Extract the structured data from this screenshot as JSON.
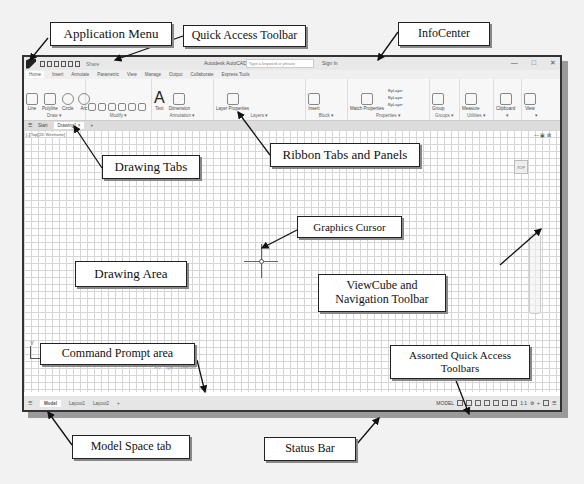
{
  "app": {
    "title": "Autodesk AutoCAD 2024   Drawing1.dwg",
    "share_label": "Share",
    "search_placeholder": "Type a keyword or phrase",
    "signin_label": "Sign In",
    "window_controls": [
      "—",
      "□",
      "✕"
    ]
  },
  "ribbon_tabs": [
    "Home",
    "Insert",
    "Annotate",
    "Parametric",
    "View",
    "Manage",
    "Output",
    "Collaborate",
    "Express Tools"
  ],
  "ribbon_panels": {
    "draw": {
      "title": "Draw ▾",
      "tools": [
        "Line",
        "Polyline",
        "Circle",
        "Arc"
      ]
    },
    "modify": {
      "title": "Modify ▾"
    },
    "annotation": {
      "title": "Annotation ▾",
      "tools": [
        "Text",
        "Dimension"
      ]
    },
    "layers": {
      "title": "Layers ▾",
      "tools": [
        "Layer Properties"
      ]
    },
    "block": {
      "title": "Block ▾",
      "tools": [
        "Insert"
      ]
    },
    "properties": {
      "title": "Properties ▾",
      "tools": [
        "Match Properties"
      ],
      "values": [
        "ByLayer",
        "ByLayer",
        "ByLayer"
      ]
    },
    "groups": {
      "title": "Groups ▾",
      "tools": [
        "Group"
      ]
    },
    "utilities": {
      "title": "Utilities ▾",
      "tools": [
        "Measure"
      ]
    },
    "clipboard": {
      "title": "▾",
      "tools": [
        "Clipboard"
      ]
    },
    "view": {
      "title": "▾",
      "tools": [
        "View"
      ]
    }
  },
  "doc_tabs": {
    "items": [
      "Start",
      "Drawing1"
    ],
    "active": "Drawing1",
    "close": "×",
    "add": "+"
  },
  "canvas": {
    "view_label": "[-][Top][2D Wireframe]",
    "viewcube_label": "TOP",
    "ucs_x": "X",
    "ucs_y": "Y",
    "command_placeholder": "Type a command"
  },
  "layout_tabs": {
    "items": [
      "Model",
      "Layout1",
      "Layout2"
    ],
    "active": "Model",
    "add": "+"
  },
  "status_bar": {
    "model_label": "MODEL",
    "scale": "1:1"
  },
  "callouts": {
    "application_menu": "Application Menu",
    "quick_access_toolbar": "Quick Access Toolbar",
    "infocenter": "InfoCenter",
    "drawing_tabs": "Drawing Tabs",
    "ribbon_tabs_panels": "Ribbon Tabs and Panels",
    "graphics_cursor": "Graphics Cursor",
    "drawing_area": "Drawing Area",
    "viewcube_nav": "ViewCube and Navigation Toolbar",
    "command_prompt": "Command Prompt area",
    "assorted_qat": "Assorted Quick Access Toolbars",
    "model_space_tab": "Model Space tab",
    "status_bar": "Status Bar"
  }
}
